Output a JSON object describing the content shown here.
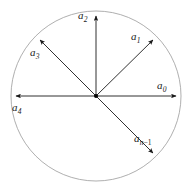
{
  "figure": {
    "background_color": "#ffffff",
    "circle": {
      "name": "unit-circle",
      "cx": 96,
      "cy": 96,
      "r": 85,
      "stroke_color": "#9a9a9a",
      "stroke_width": 0.8,
      "fill": "none"
    },
    "center_dot": {
      "name": "origin-point",
      "cx": 96,
      "cy": 96,
      "r": 2,
      "color": "#000000"
    },
    "arrow_color": "#1a1a1a",
    "arrow_width": 0.9,
    "vectors": [
      {
        "id": "a0",
        "label_base": "a",
        "label_sub": "0",
        "angle_deg": 0,
        "length": 80,
        "tip_x": 176,
        "tip_y": 96,
        "label_x": 157,
        "label_y": 80
      },
      {
        "id": "a1",
        "label_base": "a",
        "label_sub": "1",
        "angle_deg": 45,
        "length": 80,
        "tip_x": 153,
        "tip_y": 40,
        "label_x": 131,
        "label_y": 31
      },
      {
        "id": "a2",
        "label_base": "a",
        "label_sub": "2",
        "angle_deg": 90,
        "length": 80,
        "tip_x": 96,
        "tip_y": 16,
        "label_x": 78,
        "label_y": 10
      },
      {
        "id": "a3",
        "label_base": "a",
        "label_sub": "3",
        "angle_deg": 135,
        "length": 80,
        "tip_x": 40,
        "tip_y": 40,
        "label_x": 30,
        "label_y": 47
      },
      {
        "id": "a4",
        "label_base": "a",
        "label_sub": "4",
        "angle_deg": 180,
        "length": 80,
        "tip_x": 16,
        "tip_y": 96,
        "label_x": 12,
        "label_y": 102
      },
      {
        "id": "an-1",
        "label_base": "a",
        "label_sub": "n−1",
        "label_sub_var": "n",
        "label_sub_op": "−1",
        "angle_deg": -45,
        "length": 80,
        "tip_x": 153,
        "tip_y": 153,
        "label_x": 134,
        "label_y": 133
      }
    ]
  }
}
